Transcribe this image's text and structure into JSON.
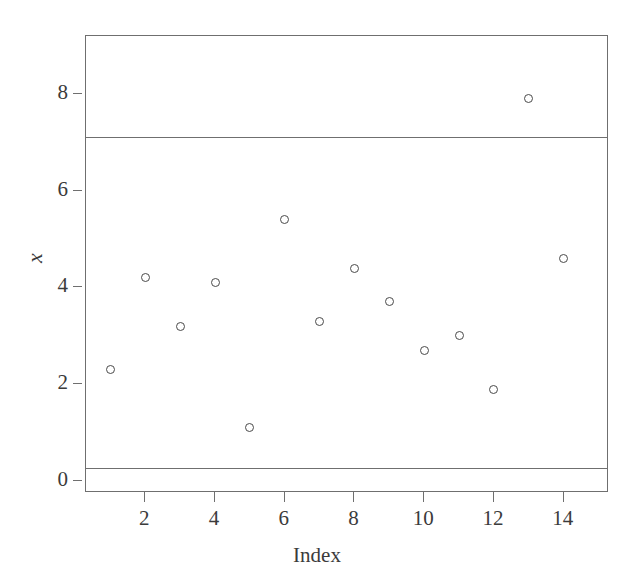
{
  "chart_data": {
    "type": "scatter",
    "title": "",
    "xlabel": "Index",
    "ylabel": "x",
    "x": [
      1,
      2,
      3,
      4,
      5,
      6,
      7,
      8,
      9,
      10,
      11,
      12,
      13,
      14
    ],
    "values": [
      2.3,
      4.2,
      3.2,
      4.1,
      1.1,
      5.4,
      3.3,
      4.4,
      3.7,
      2.7,
      3.0,
      1.9,
      7.9,
      4.6
    ],
    "series": [
      {
        "name": "x",
        "values": [
          2.3,
          4.2,
          3.2,
          4.1,
          1.1,
          5.4,
          3.3,
          4.4,
          3.7,
          2.7,
          3.0,
          1.9,
          7.9,
          4.6
        ]
      }
    ],
    "xlim": [
      0.3,
      15.3
    ],
    "ylim": [
      -0.25,
      9.2
    ],
    "xticks": [
      2,
      4,
      6,
      8,
      10,
      12,
      14
    ],
    "yticks": [
      0,
      2,
      4,
      6,
      8
    ],
    "xtick_labels": [
      "2",
      "4",
      "6",
      "8",
      "10",
      "12",
      "14"
    ],
    "ytick_labels": [
      "0",
      "2",
      "4",
      "6",
      "8"
    ],
    "grid": false,
    "legend": "none",
    "marker": "open-circle",
    "reference_lines": [
      {
        "name": "upper-control-limit",
        "value": 7.12,
        "orientation": "horizontal"
      },
      {
        "name": "lower-control-limit",
        "value": 0.26,
        "orientation": "horizontal"
      }
    ],
    "colors": {
      "marker_stroke": "#4a4a4a",
      "frame": "#6f6f6f",
      "limit_line": "#6f6f6f",
      "text": "#3b3b3b",
      "background": "#ffffff"
    }
  }
}
